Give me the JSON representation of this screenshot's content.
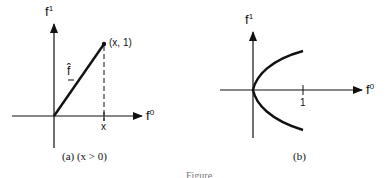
{
  "panel_a": {
    "y_axis_label": "f",
    "y_axis_sup": "1",
    "x_axis_label": "f",
    "x_axis_sup": "0",
    "point_label": "(x, 1)",
    "vector_label": "f̂",
    "x_tick_label": "x",
    "caption": "(a) (x > 0)"
  },
  "panel_b": {
    "y_axis_label": "f",
    "y_axis_sup": "1",
    "x_axis_label": "f",
    "x_axis_sup": "0",
    "x_tick_label": "1",
    "caption": "(b)"
  },
  "figure_caption_fragment": "Figure"
}
